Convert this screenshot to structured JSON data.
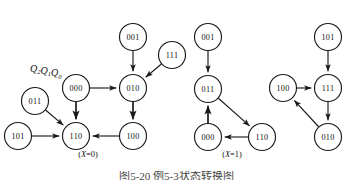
{
  "figure": {
    "variable_label": {
      "base1": "Q",
      "sub1": "2",
      "base2": "Q",
      "sub2": "1",
      "base3": "Q",
      "sub3": "0",
      "text": "Q2Q1Q0"
    },
    "bottom_caption": "图5-20  例5-3状态转换图",
    "colors": {
      "stroke": "#1a1a1a",
      "text": "#111111",
      "background": "#ffffff"
    },
    "diagrams": [
      {
        "id": "x-equals-0",
        "caption_prefix": "(",
        "caption_var": "X",
        "caption_suffix": "=0)",
        "caption": "(X=0)",
        "caption_x": 88,
        "caption_y": 157,
        "nodes": [
          {
            "label": "001",
            "cx": 133,
            "cy": 37,
            "r": 13.5
          },
          {
            "label": "111",
            "cx": 172,
            "cy": 55,
            "r": 13.5
          },
          {
            "label": "000",
            "cx": 76,
            "cy": 88,
            "r": 13.5
          },
          {
            "label": "010",
            "cx": 133,
            "cy": 88,
            "r": 13.5
          },
          {
            "label": "011",
            "cx": 35,
            "cy": 101,
            "r": 13.5
          },
          {
            "label": "101",
            "cx": 18,
            "cy": 136,
            "r": 13.5
          },
          {
            "label": "110",
            "cx": 76,
            "cy": 136,
            "r": 13.5
          },
          {
            "label": "100",
            "cx": 133,
            "cy": 136,
            "r": 13.5
          }
        ],
        "edges": [
          {
            "from": "001",
            "to": "010",
            "kind": "straight",
            "weight": "normal"
          },
          {
            "from": "111",
            "to": "010",
            "kind": "straight",
            "weight": "normal"
          },
          {
            "from": "000",
            "to": "010",
            "kind": "straight",
            "weight": "normal"
          },
          {
            "from": "000",
            "to": "110",
            "kind": "straight",
            "weight": "thick"
          },
          {
            "from": "011",
            "to": "110",
            "kind": "straight",
            "weight": "normal"
          },
          {
            "from": "101",
            "to": "110",
            "kind": "straight",
            "weight": "normal"
          },
          {
            "from": "010",
            "to": "100",
            "kind": "straight",
            "weight": "thick"
          },
          {
            "from": "100",
            "to": "110",
            "kind": "straight",
            "weight": "normal"
          }
        ]
      },
      {
        "id": "x-equals-1",
        "caption_prefix": "(",
        "caption_var": "X",
        "caption_suffix": "=1)",
        "caption": "(X=1)",
        "caption_x": 232,
        "caption_y": 157,
        "nodes": [
          {
            "label": "001",
            "cx": 208,
            "cy": 37,
            "r": 13.5
          },
          {
            "label": "011",
            "cx": 208,
            "cy": 89,
            "r": 13.5
          },
          {
            "label": "000",
            "cx": 208,
            "cy": 137,
            "r": 13.5
          },
          {
            "label": "110",
            "cx": 262,
            "cy": 137,
            "r": 13.5
          }
        ],
        "edges": [
          {
            "from": "001",
            "to": "011",
            "kind": "straight",
            "weight": "normal"
          },
          {
            "from": "011",
            "to": "110",
            "kind": "straight",
            "weight": "normal"
          },
          {
            "from": "110",
            "to": "000",
            "kind": "straight",
            "weight": "normal"
          },
          {
            "from": "000",
            "to": "011",
            "kind": "straight",
            "weight": "thick"
          }
        ]
      },
      {
        "id": "x-equals-1-right",
        "caption_prefix": "",
        "caption_var": "",
        "caption_suffix": "",
        "caption": "",
        "caption_x": 318,
        "caption_y": 157,
        "nodes": [
          {
            "label": "101",
            "cx": 328,
            "cy": 37,
            "r": 13.5
          },
          {
            "label": "100",
            "cx": 283,
            "cy": 88,
            "r": 13.5
          },
          {
            "label": "111",
            "cx": 328,
            "cy": 88,
            "r": 13.5
          },
          {
            "label": "010",
            "cx": 328,
            "cy": 137,
            "r": 13.5
          }
        ],
        "edges": [
          {
            "from": "101",
            "to": "111",
            "kind": "straight",
            "weight": "normal"
          },
          {
            "from": "100",
            "to": "111",
            "kind": "straight",
            "weight": "normal"
          },
          {
            "from": "111",
            "to": "010",
            "kind": "straight",
            "weight": "normal"
          },
          {
            "from": "010",
            "to": "100",
            "kind": "straight",
            "weight": "normal"
          }
        ]
      }
    ]
  }
}
